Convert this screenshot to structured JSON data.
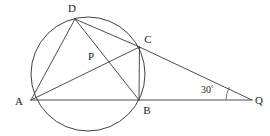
{
  "figure": {
    "stroke_color": "#3a3a3a",
    "label_color": "#1d1d1d",
    "background_color": "#ffffff"
  },
  "labels": {
    "A": "A",
    "B": "B",
    "C": "C",
    "D": "D",
    "P": "P",
    "Q": "Q",
    "angle_q_value": "30",
    "angle_q_unit": "°"
  },
  "geometry": {
    "circle": {
      "cx": 88,
      "cy": 74,
      "r": 57
    },
    "points": {
      "A": {
        "x": 31,
        "y": 100
      },
      "B": {
        "x": 139,
        "y": 100
      },
      "C": {
        "x": 139.5,
        "y": 47
      },
      "D": {
        "x": 75,
        "y": 19
      },
      "P": {
        "x": 100,
        "y": 62
      },
      "Q": {
        "x": 252,
        "y": 100
      }
    },
    "label_positions": {
      "A": {
        "x": 19,
        "y": 105
      },
      "B": {
        "x": 144,
        "y": 113
      },
      "C": {
        "x": 145,
        "y": 43
      },
      "D": {
        "x": 69,
        "y": 11
      },
      "P": {
        "x": 88,
        "y": 60
      },
      "Q": {
        "x": 257,
        "y": 104
      },
      "angle": {
        "x": 200,
        "y": 93
      }
    },
    "segments": [
      {
        "name": "segment-AD",
        "from": "A",
        "to": "D"
      },
      {
        "name": "segment-AC-extended-to-Q",
        "from": "A",
        "to": "Q"
      },
      {
        "name": "segment-AB-extended-to-Q",
        "from": "A",
        "to": "Q"
      },
      {
        "name": "segment-DB",
        "from": "D",
        "to": "B"
      },
      {
        "name": "segment-DC-extended-to-Q",
        "from": "D",
        "to": "Q"
      },
      {
        "name": "segment-CB",
        "from": "C",
        "to": "B"
      }
    ],
    "angle_arc": {
      "vertex": "Q",
      "radius": 26,
      "label": "30°"
    }
  }
}
